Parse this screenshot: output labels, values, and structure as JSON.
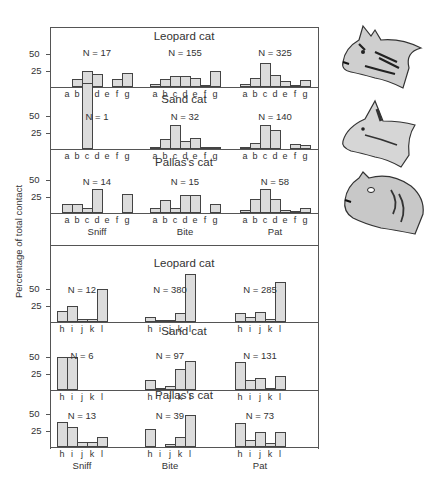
{
  "figure": {
    "ylabel": "Percentage of total contact",
    "tick_labels": [
      "50",
      "25"
    ]
  },
  "chart_data": [
    {
      "type": "bar",
      "section": "upper",
      "ylabel": "Percentage of total contact",
      "yticks": [
        25,
        50
      ],
      "categories": [
        "a",
        "b",
        "c",
        "d",
        "e",
        "f",
        "g"
      ],
      "column_labels": [
        "Sniff",
        "Bite",
        "Pat"
      ],
      "rows": [
        {
          "title": "Leopard cat",
          "panels": [
            {
              "behavior": "Sniff",
              "n_label": "N = 17",
              "values": [
                0,
                12,
                24,
                20,
                0,
                12,
                21
              ]
            },
            {
              "behavior": "Bite",
              "n_label": "N = 155",
              "values": [
                4,
                12,
                17,
                17,
                14,
                3,
                25
              ]
            },
            {
              "behavior": "Pat",
              "n_label": "N = 325",
              "values": [
                5,
                13,
                37,
                18,
                9,
                2,
                11
              ]
            }
          ]
        },
        {
          "title": "Sand cat",
          "panels": [
            {
              "behavior": "Sniff",
              "n_label": "N = 1",
              "values": [
                0,
                0,
                100,
                0,
                0,
                0,
                0
              ]
            },
            {
              "behavior": "Bite",
              "n_label": "N = 32",
              "values": [
                3,
                15,
                37,
                12,
                16,
                3,
                3
              ]
            },
            {
              "behavior": "Pat",
              "n_label": "N = 140",
              "values": [
                2,
                9,
                36,
                29,
                0,
                7,
                6
              ]
            }
          ]
        },
        {
          "title": "Pallas's cat",
          "panels": [
            {
              "behavior": "Sniff",
              "n_label": "N = 14",
              "values": [
                14,
                14,
                7,
                36,
                0,
                0,
                29
              ]
            },
            {
              "behavior": "Bite",
              "n_label": "N = 15",
              "values": [
                7,
                20,
                7,
                27,
                27,
                0,
                13
              ]
            },
            {
              "behavior": "Pat",
              "n_label": "N = 58",
              "values": [
                5,
                21,
                36,
                21,
                5,
                2,
                7
              ]
            }
          ]
        }
      ]
    },
    {
      "type": "bar",
      "section": "lower",
      "ylabel": "Percentage of total contact",
      "yticks": [
        25,
        50
      ],
      "categories": [
        "h",
        "i",
        "j",
        "k",
        "l"
      ],
      "column_labels": [
        "Sniff",
        "Bite",
        "Pat"
      ],
      "rows": [
        {
          "title": "Leopard cat",
          "panels": [
            {
              "behavior": "Sniff",
              "n_label": "N = 12",
              "values": [
                17,
                25,
                4,
                4,
                50
              ]
            },
            {
              "behavior": "Bite",
              "n_label": "N = 380",
              "values": [
                8,
                2,
                3,
                14,
                73
              ]
            },
            {
              "behavior": "Pat",
              "n_label": "N = 285",
              "values": [
                13,
                7,
                15,
                4,
                60
              ]
            }
          ]
        },
        {
          "title": "Sand cat",
          "panels": [
            {
              "behavior": "Sniff",
              "n_label": "N = 6",
              "values": [
                50,
                50,
                0,
                0,
                0
              ]
            },
            {
              "behavior": "Bite",
              "n_label": "N = 97",
              "values": [
                15,
                3,
                6,
                32,
                44
              ]
            },
            {
              "behavior": "Pat",
              "n_label": "N = 131",
              "values": [
                43,
                15,
                18,
                3,
                21
              ]
            }
          ]
        },
        {
          "title": "Pallas's cat",
          "panels": [
            {
              "behavior": "Sniff",
              "n_label": "N = 13",
              "values": [
                38,
                31,
                8,
                8,
                15
              ]
            },
            {
              "behavior": "Bite",
              "n_label": "N = 39",
              "values": [
                28,
                0,
                5,
                15,
                49
              ]
            },
            {
              "behavior": "Pat",
              "n_label": "N = 73",
              "values": [
                36,
                10,
                22,
                6,
                22
              ]
            }
          ]
        }
      ]
    }
  ],
  "illustrations": [
    {
      "name": "leopard-cat-head",
      "caption": ""
    },
    {
      "name": "sand-cat-head",
      "caption": ""
    },
    {
      "name": "pallas-cat-head",
      "caption": ""
    }
  ]
}
